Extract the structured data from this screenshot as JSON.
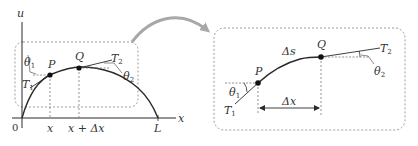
{
  "colors": {
    "stroke": "#2a2a2a",
    "dash": "#9a9a9a",
    "arrow": "#a8a8a8",
    "text": "#333333"
  },
  "left_panel": {
    "axis_u_label": "u",
    "axis_x_label": "x",
    "origin_label": "0",
    "point_p_label": "P",
    "point_q_label": "Q",
    "tension_1_label": "T",
    "tension_1_sub": "1",
    "tension_2_label": "T",
    "tension_2_sub": "2",
    "angle_1_label": "θ",
    "angle_1_sub": "1",
    "angle_2_label": "θ",
    "angle_2_sub": "2",
    "tick_x_label": "x",
    "tick_x_dx_label": "x + Δx",
    "tick_l_label": "L"
  },
  "right_panel": {
    "point_p_label": "P",
    "point_q_label": "Q",
    "arc_length_label": "Δs",
    "dx_label": "Δx",
    "tension_1_label": "T",
    "tension_1_sub": "1",
    "tension_2_label": "T",
    "tension_2_sub": "2",
    "angle_1_label": "θ",
    "angle_1_sub": "1",
    "angle_2_label": "θ",
    "angle_2_sub": "2"
  }
}
